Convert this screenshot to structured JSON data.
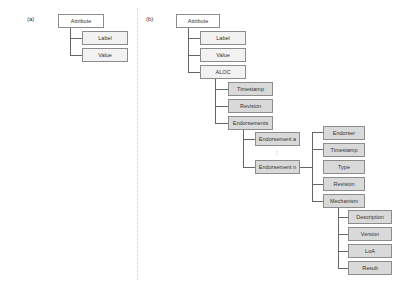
{
  "panels": {
    "a": {
      "label": "(a)",
      "root": "Attribute",
      "children": [
        "Label",
        "Value"
      ]
    },
    "b": {
      "label": "(b)",
      "root": "Attribute",
      "children": [
        "Label",
        "Value",
        "ALOC"
      ],
      "aloc_children": [
        "Timestamp",
        "Revision",
        "Endorsements"
      ],
      "endorsements": [
        "Endorsement a",
        "Endorsement n"
      ],
      "ellipsis": ":",
      "endorsement_fields": [
        "Endorser",
        "Timestamp",
        "Type",
        "Revision",
        "Mechanism"
      ],
      "mechanism_fields": [
        "Description",
        "Version",
        "LoA",
        "Result"
      ]
    }
  },
  "colors": {
    "root_fill": "#ffffff",
    "level1_fill": "#f2f2f2",
    "level2_fill": "#d9d9d9",
    "border": "#8c8c8c",
    "connector": "#666666"
  }
}
